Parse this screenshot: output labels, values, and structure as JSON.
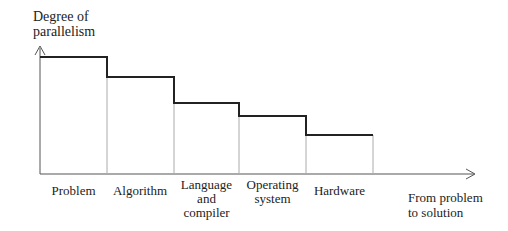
{
  "diagram": {
    "y_axis_label_line1": "Degree of",
    "y_axis_label_line2": "parallelism",
    "x_axis_label_line1": "From problem",
    "x_axis_label_line2": "to solution",
    "stages": [
      {
        "line1": "Problem",
        "line2": "",
        "line3": "",
        "level": 5
      },
      {
        "line1": "Algorithm",
        "line2": "",
        "line3": "",
        "level": 4
      },
      {
        "line1": "Language",
        "line2": "and",
        "line3": "compiler",
        "level": 3
      },
      {
        "line1": "Operating",
        "line2": "system",
        "line3": "",
        "level": 2
      },
      {
        "line1": "Hardware",
        "line2": "",
        "line3": "",
        "level": 1
      }
    ]
  },
  "colors": {
    "step_line": "#222222",
    "divider": "#aaaaaa",
    "axis": "#444444"
  }
}
